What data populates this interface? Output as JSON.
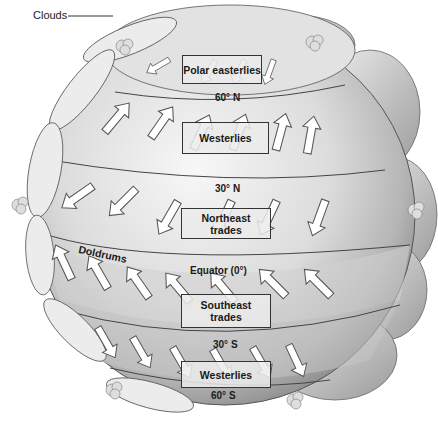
{
  "diagram": {
    "callouts": {
      "clouds": "Clouds"
    },
    "wind_belts": [
      {
        "name": "Polar easterlies",
        "hemisphere": "north"
      },
      {
        "name": "Westerlies",
        "hemisphere": "north"
      },
      {
        "name": "Northeast trades",
        "hemisphere": "north",
        "line1": "Northeast",
        "line2": "trades"
      },
      {
        "name": "Southeast trades",
        "hemisphere": "south",
        "line1": "Southeast",
        "line2": "trades"
      },
      {
        "name": "Westerlies",
        "hemisphere": "south"
      }
    ],
    "latitudes": {
      "n60": "60° N",
      "n30": "30° N",
      "equator": "Equator (0°)",
      "s30": "30° S",
      "s60": "60° S"
    },
    "zones": {
      "doldrums": "Doldrums"
    },
    "colors": {
      "globe_light": "#f2f2f2",
      "globe_mid": "#cfcfcf",
      "globe_dark": "#8a8a8a",
      "arrow_fill": "#ffffff",
      "arrow_stroke": "#555555",
      "line": "#444444",
      "text": "#1a1a1a"
    }
  }
}
